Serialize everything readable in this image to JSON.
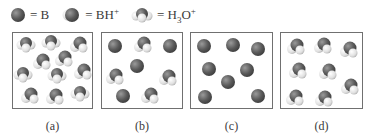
{
  "legend": {
    "items": [
      {
        "species": "B",
        "label": "= B",
        "glyph": "base-sphere-icon"
      },
      {
        "species": "BH+",
        "label_main": "= BH",
        "label_sup": "+",
        "glyph": "conjugate-acid-icon"
      },
      {
        "species": "H3O+",
        "label_main": "= H",
        "label_sub": "3",
        "label_mid": "O",
        "label_sup": "+",
        "glyph": "hydronium-icon"
      }
    ]
  },
  "colors": {
    "dark_atom": "#5a5a5a",
    "dark_atom_highlight": "#9a9a9a",
    "light_atom": "#e6e6e6",
    "light_atom_shade": "#b5b5b5",
    "box_border": "#707070",
    "text": "#3a3a3a"
  },
  "panels": [
    {
      "id": "a",
      "label": "(a)",
      "left": 12,
      "width": 81,
      "particles": [
        {
          "type": "H3O+",
          "x": 13,
          "y": 12
        },
        {
          "type": "H3O+",
          "x": 38,
          "y": 10
        },
        {
          "type": "BH+",
          "x": 66,
          "y": 11
        },
        {
          "type": "BH+",
          "x": 29,
          "y": 28
        },
        {
          "type": "BH+",
          "x": 51,
          "y": 25
        },
        {
          "type": "H3O+",
          "x": 10,
          "y": 42
        },
        {
          "type": "H3O+",
          "x": 44,
          "y": 43
        },
        {
          "type": "BH+",
          "x": 70,
          "y": 38
        },
        {
          "type": "BH+",
          "x": 17,
          "y": 62
        },
        {
          "type": "BH+",
          "x": 42,
          "y": 63
        },
        {
          "type": "H3O+",
          "x": 67,
          "y": 61
        }
      ]
    },
    {
      "id": "b",
      "label": "(b)",
      "left": 101,
      "width": 82,
      "particles": [
        {
          "type": "B",
          "x": 13,
          "y": 13
        },
        {
          "type": "BH+",
          "x": 41,
          "y": 11
        },
        {
          "type": "B",
          "x": 68,
          "y": 13
        },
        {
          "type": "B",
          "x": 35,
          "y": 33
        },
        {
          "type": "BH+",
          "x": 13,
          "y": 43
        },
        {
          "type": "BH+",
          "x": 66,
          "y": 44
        },
        {
          "type": "B",
          "x": 21,
          "y": 63
        },
        {
          "type": "BH+",
          "x": 48,
          "y": 62
        }
      ]
    },
    {
      "id": "c",
      "label": "(c)",
      "left": 190,
      "width": 83,
      "particles": [
        {
          "type": "B",
          "x": 13,
          "y": 13
        },
        {
          "type": "B",
          "x": 42,
          "y": 12
        },
        {
          "type": "B",
          "x": 67,
          "y": 16
        },
        {
          "type": "B",
          "x": 18,
          "y": 36
        },
        {
          "type": "B",
          "x": 56,
          "y": 37
        },
        {
          "type": "B",
          "x": 37,
          "y": 49
        },
        {
          "type": "B",
          "x": 14,
          "y": 64
        },
        {
          "type": "B",
          "x": 67,
          "y": 63
        }
      ]
    },
    {
      "id": "d",
      "label": "(d)",
      "left": 280,
      "width": 83,
      "particles": [
        {
          "type": "BH+",
          "x": 15,
          "y": 13
        },
        {
          "type": "BH+",
          "x": 42,
          "y": 12
        },
        {
          "type": "BH+",
          "x": 68,
          "y": 16
        },
        {
          "type": "BH+",
          "x": 17,
          "y": 37
        },
        {
          "type": "BH+",
          "x": 47,
          "y": 38
        },
        {
          "type": "BH+",
          "x": 69,
          "y": 53
        },
        {
          "type": "BH+",
          "x": 14,
          "y": 64
        },
        {
          "type": "BH+",
          "x": 43,
          "y": 65
        }
      ]
    }
  ]
}
